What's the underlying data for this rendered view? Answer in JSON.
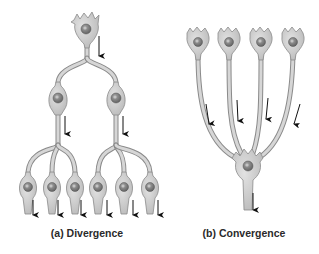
{
  "figure": {
    "panels": [
      {
        "id": "a",
        "label": "(a) Divergence",
        "description": "One presynaptic neuron branches to two neurons, each of which branches to three neurons",
        "levels": [
          1,
          2,
          6
        ]
      },
      {
        "id": "b",
        "label": "(b) Convergence",
        "description": "Four presynaptic neurons converge onto a single postsynaptic neuron",
        "levels": [
          4,
          1
        ]
      }
    ],
    "colors": {
      "cell_fill": "#c9c9c9",
      "cell_stroke": "#8a8a8a",
      "nucleus_fill": "#7d7d7d",
      "nucleolus_fill": "#b8b8b8",
      "arrow": "#111111",
      "caption": "#2a2a2a",
      "background": "#ffffff"
    },
    "arrow_direction": "down"
  }
}
